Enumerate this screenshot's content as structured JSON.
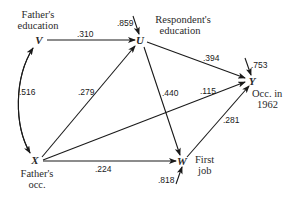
{
  "diagram": {
    "type": "path-diagram",
    "nodes": {
      "V": {
        "symbol": "V",
        "label_line1": "Father's",
        "label_line2": "education"
      },
      "U": {
        "symbol": "U",
        "label_line1": "Respondent's",
        "label_line2": "education"
      },
      "Y": {
        "symbol": "Y",
        "label_line1": "Occ. in",
        "label_line2": "1962"
      },
      "X": {
        "symbol": "X",
        "label_line1": "Father's",
        "label_line2": "occ."
      },
      "W": {
        "symbol": "W",
        "label_line1": "First",
        "label_line2": "job"
      }
    },
    "edges": {
      "V_U": {
        "from": "V",
        "to": "U",
        "coef": ".310"
      },
      "X_V": {
        "from": "X",
        "to": "V",
        "coef": ".516",
        "kind": "correlation"
      },
      "X_U": {
        "from": "X",
        "to": "U",
        "coef": ".279"
      },
      "U_Y": {
        "from": "U",
        "to": "Y",
        "coef": ".394"
      },
      "U_W": {
        "from": "U",
        "to": "W",
        "coef": ".440"
      },
      "X_Y": {
        "from": "X",
        "to": "Y",
        "coef": ".115"
      },
      "X_W": {
        "from": "X",
        "to": "W",
        "coef": ".224"
      },
      "W_Y": {
        "from": "W",
        "to": "Y",
        "coef": ".281"
      }
    },
    "residuals": {
      "U": {
        "coef": ".859"
      },
      "Y": {
        "coef": ".753"
      },
      "W": {
        "coef": ".818"
      }
    }
  }
}
